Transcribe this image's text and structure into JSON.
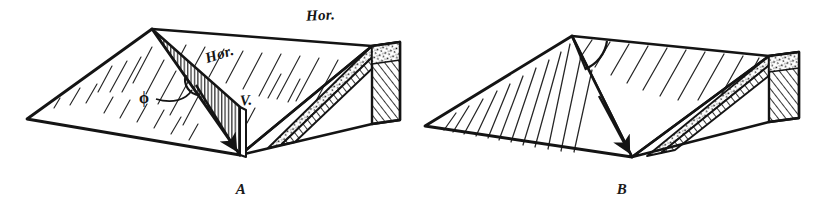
{
  "figure": {
    "background_color": "#ffffff",
    "ink_color": "#141414",
    "width": 823,
    "height": 216
  },
  "panels": [
    {
      "id": "A",
      "caption": "A",
      "labels": {
        "hor_top": "Hor.",
        "hor_mid": "Hor.",
        "vertical": "V.",
        "angle_symbol": "ϕ"
      },
      "angle_name": "phi",
      "features": [
        "hachured-dip-surface",
        "vertical-section-plane",
        "dip-direction-arrow",
        "stippled-bed",
        "hatched-bed"
      ]
    },
    {
      "id": "B",
      "caption": "B",
      "labels": {
        "hor_top": "Hor.",
        "vertical": "V",
        "angle_symbol": "π"
      },
      "angle_name": "pi",
      "features": [
        "hachured-dip-surface",
        "dip-direction-arrow",
        "stippled-bed",
        "hatched-bed"
      ]
    }
  ]
}
